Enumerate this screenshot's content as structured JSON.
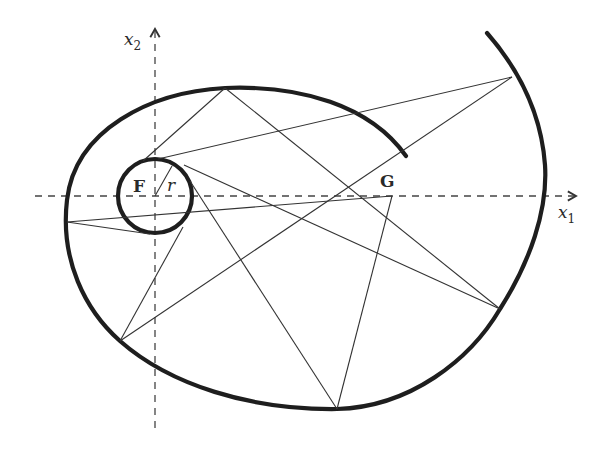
{
  "diagram": {
    "type": "geometric-construction",
    "colors": {
      "background": "#ffffff",
      "curve": "#1e1e1e",
      "rays": "#333333",
      "axes": "#444444"
    },
    "axes": {
      "x1": {
        "label": "x",
        "subscript": "1"
      },
      "x2": {
        "label": "x",
        "subscript": "2"
      }
    },
    "points": {
      "F": {
        "label": "F",
        "x": 155,
        "y": 196
      },
      "G": {
        "label": "G",
        "x": 392,
        "y": 196
      }
    },
    "circle": {
      "center": "F",
      "radius_label": "r",
      "radius_px": 37
    },
    "rays": [
      {
        "from": [
          225,
          88
        ],
        "to": [
          143,
          161
        ]
      },
      {
        "from": [
          225,
          88
        ],
        "to": [
          500,
          309
        ]
      },
      {
        "from": [
          512,
          77
        ],
        "to": [
          158,
          159
        ]
      },
      {
        "from": [
          512,
          77
        ],
        "to": [
          120,
          341
        ]
      },
      {
        "from": [
          67,
          222
        ],
        "to": [
          392,
          196
        ]
      },
      {
        "from": [
          67,
          222
        ],
        "to": [
          150,
          234
        ]
      },
      {
        "from": [
          184,
          165
        ],
        "to": [
          500,
          309
        ]
      },
      {
        "from": [
          190,
          181
        ],
        "to": [
          337,
          409
        ]
      },
      {
        "from": [
          337,
          409
        ],
        "to": [
          392,
          196
        ]
      },
      {
        "from": [
          120,
          341
        ],
        "to": [
          183,
          227
        ]
      }
    ]
  }
}
